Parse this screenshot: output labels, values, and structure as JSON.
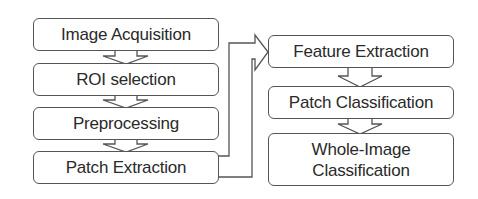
{
  "diagram": {
    "type": "flowchart",
    "left_column": [
      {
        "id": "image-acquisition",
        "label": "Image Acquisition"
      },
      {
        "id": "roi-selection",
        "label": "ROI selection"
      },
      {
        "id": "preprocessing",
        "label": "Preprocessing"
      },
      {
        "id": "patch-extraction",
        "label": "Patch Extraction"
      }
    ],
    "right_column": [
      {
        "id": "feature-extraction",
        "label": "Feature Extraction"
      },
      {
        "id": "patch-classification",
        "label": "Patch Classification"
      },
      {
        "id": "whole-image-classification",
        "label_line1": "Whole-Image",
        "label_line2": "Classification"
      }
    ],
    "edges": [
      {
        "from": "image-acquisition",
        "to": "roi-selection"
      },
      {
        "from": "roi-selection",
        "to": "preprocessing"
      },
      {
        "from": "preprocessing",
        "to": "patch-extraction"
      },
      {
        "from": "patch-extraction",
        "to": "feature-extraction"
      },
      {
        "from": "feature-extraction",
        "to": "patch-classification"
      },
      {
        "from": "patch-classification",
        "to": "whole-image-classification"
      }
    ],
    "colors": {
      "stroke": "#555555",
      "text": "#2a2a2a",
      "background": "#ffffff"
    }
  }
}
